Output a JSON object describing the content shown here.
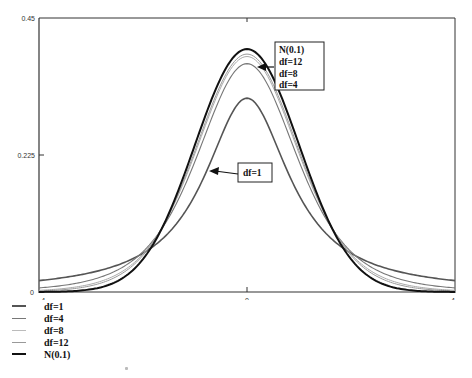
{
  "chart_data": {
    "type": "line",
    "title": "",
    "xlabel": "",
    "ylabel": "",
    "xlim": [
      -4,
      4
    ],
    "ylim": [
      0,
      0.45
    ],
    "x_ticks": [
      "-4",
      "0",
      "4"
    ],
    "y_ticks": [
      "0",
      "0.225",
      "0.45"
    ],
    "grid": false,
    "legend_position": "bottom-left",
    "series": [
      {
        "name": "df=1",
        "distribution": "Student t",
        "df": 1,
        "peak": 0.318,
        "color": "#555555",
        "width": 1.6
      },
      {
        "name": "df=4",
        "distribution": "Student t",
        "df": 4,
        "peak": 0.375,
        "color": "#777777",
        "width": 1.1
      },
      {
        "name": "df=8",
        "distribution": "Student t",
        "df": 8,
        "peak": 0.387,
        "color": "#aaaaaa",
        "width": 1.0
      },
      {
        "name": "df=12",
        "distribution": "Student t",
        "df": 12,
        "peak": 0.391,
        "color": "#999999",
        "width": 1.0
      },
      {
        "name": "N(0.1)",
        "distribution": "Normal",
        "df": null,
        "peak": 0.399,
        "color": "#111111",
        "width": 2.0
      }
    ],
    "sample_points": {
      "x": [
        -4,
        -3,
        -2,
        -1,
        0,
        1,
        2,
        3,
        4
      ],
      "df=1": [
        0.019,
        0.032,
        0.064,
        0.159,
        0.318,
        0.159,
        0.064,
        0.032,
        0.019
      ],
      "df=4": [
        0.007,
        0.022,
        0.066,
        0.215,
        0.375,
        0.215,
        0.066,
        0.022,
        0.007
      ],
      "df=8": [
        0.002,
        0.013,
        0.063,
        0.23,
        0.387,
        0.23,
        0.063,
        0.013,
        0.002
      ],
      "df=12": [
        0.001,
        0.01,
        0.061,
        0.234,
        0.391,
        0.234,
        0.061,
        0.01,
        0.001
      ],
      "N(0.1)": [
        0.0001,
        0.004,
        0.054,
        0.242,
        0.399,
        0.242,
        0.054,
        0.004,
        0.0001
      ]
    },
    "annotations": [
      {
        "lines": [
          "N(0.1)",
          "df=12",
          "df=8",
          "df=4"
        ],
        "points_to": "peak cluster"
      },
      {
        "lines": [
          "df=1"
        ],
        "points_to": "df=1 curve"
      }
    ]
  },
  "axis": {
    "y_top": "0.45",
    "y_mid": "0.225",
    "y_zero": "0",
    "x_left": "-4",
    "x_mid": "0",
    "x_right": "4"
  },
  "annotation_top": [
    "N(0.1)",
    "df=12",
    "df=8",
    "df=4"
  ],
  "annotation_df1": "df=1",
  "legend": [
    {
      "label": "df=1",
      "color": "#555555",
      "width": 2
    },
    {
      "label": "df=4",
      "color": "#777777",
      "width": 1
    },
    {
      "label": "df=8",
      "color": "#bbbbbb",
      "width": 1
    },
    {
      "label": "df=12",
      "color": "#999999",
      "width": 1
    },
    {
      "label": "N(0.1)",
      "color": "#111111",
      "width": 2
    }
  ]
}
